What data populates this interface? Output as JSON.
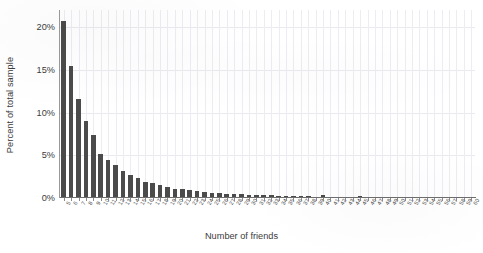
{
  "chart_data": {
    "type": "bar",
    "title": "",
    "subtitle": "",
    "xlabel": "Number of friends",
    "ylabel": "Percent of total sample",
    "grid": true,
    "legend": null,
    "ylim": [
      0,
      22
    ],
    "ytick_values": [
      0,
      5,
      10,
      15,
      20
    ],
    "ytick_labels": [
      "0%",
      "5%",
      "10%",
      "15%",
      "20%"
    ],
    "bar_color": "#4b4b4b",
    "categories": [
      "5",
      "6",
      "7",
      "8",
      "9",
      "10",
      "11",
      "12",
      "13",
      "14",
      "15",
      "16",
      "17",
      "18",
      "19",
      "20",
      "21",
      "22",
      "23",
      "24",
      "25",
      "26",
      "27",
      "28",
      "29",
      "30",
      "31",
      "32",
      "33",
      "34",
      "35",
      "36",
      "37",
      "38",
      "39",
      "40",
      "41",
      "42",
      "43",
      "44",
      "45",
      "46",
      "47",
      "48",
      "49",
      "50",
      "51",
      "52",
      "53",
      "54",
      "55",
      "56",
      "57",
      "58",
      "59",
      "60"
    ],
    "values": [
      20.7,
      15.4,
      11.6,
      9.0,
      7.4,
      5.2,
      4.5,
      3.9,
      3.2,
      2.7,
      2.3,
      1.9,
      1.7,
      1.5,
      1.3,
      1.1,
      1.0,
      0.95,
      0.85,
      0.75,
      0.6,
      0.55,
      0.5,
      0.45,
      0.42,
      0.4,
      0.38,
      0.35,
      0.3,
      0.28,
      0.25,
      0.22,
      0.2,
      0.18,
      0.17,
      0.3,
      0.15,
      0.14,
      0.12,
      0.1,
      0.25,
      0.09,
      0.08,
      0.12,
      0.1,
      0.07,
      0.05,
      0.04,
      0.04,
      0.03,
      0.12,
      0.03,
      0.02,
      0.02,
      0.02,
      0.02
    ]
  },
  "axes": {
    "y_title": "Percent of total sample",
    "x_title": "Number of friends"
  }
}
